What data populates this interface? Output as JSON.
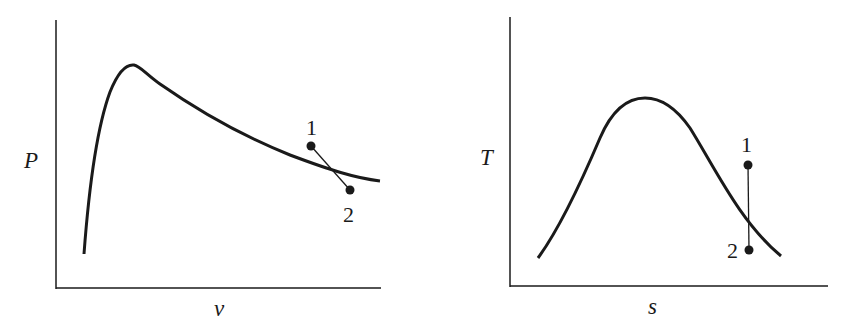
{
  "left_diagram": {
    "title": "P-v diagram",
    "ylabel": "P",
    "xlabel": "v",
    "curve": "saturation dome (vapor dome)",
    "points": [
      {
        "label": "1",
        "x": 311,
        "y": 146
      },
      {
        "label": "2",
        "x": 350,
        "y": 190
      }
    ]
  },
  "right_diagram": {
    "title": "T-s diagram",
    "ylabel": "T",
    "xlabel": "s",
    "curve": "saturation dome (vapor dome)",
    "points": [
      {
        "label": "1",
        "x": 748,
        "y": 165
      },
      {
        "label": "2",
        "x": 749,
        "y": 250
      }
    ]
  },
  "colors": {
    "ink": "#1a1a1a",
    "background": "#ffffff"
  }
}
